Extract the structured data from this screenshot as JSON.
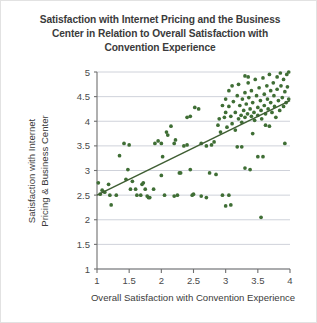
{
  "chart_data": {
    "type": "scatter",
    "title": "Satisfaction with Internet Pricing and the Business Center in Relation to Overall Satisfaction with Convention Experience",
    "title_lines": [
      "Satisfaction with Internet Pricing and the Business",
      "Center in Relation to Overall Satisfaction with",
      "Convention Experience"
    ],
    "xlabel": "Overall Satisfaction with Convention Experience",
    "ylabel": "Satisfaction with Internet Pricing & Business Center",
    "ylabel_lines": [
      "Satisfaction with Internet",
      "Pricing & Business Center"
    ],
    "xlim": [
      1,
      4
    ],
    "ylim": [
      1,
      5
    ],
    "xticks": [
      1,
      1.5,
      2,
      2.5,
      3,
      3.5,
      4
    ],
    "yticks": [
      1,
      1.5,
      2,
      2.5,
      3,
      3.5,
      4,
      4.5,
      5
    ],
    "xtick_labels": [
      "1",
      "1.5",
      "2",
      "2.5",
      "3",
      "3.5",
      "4"
    ],
    "ytick_labels": [
      "1",
      "1.5",
      "2",
      "2.5",
      "3",
      "3.5",
      "4",
      "4.5",
      "5"
    ],
    "grid": "horizontal",
    "legend": "none",
    "marker_color": "#3f6e35",
    "marker_size": 3,
    "trendline": {
      "type": "linear",
      "color": "#3f5e33",
      "x": [
        1.0,
        4.0
      ],
      "y": [
        2.5,
        4.42
      ]
    },
    "points": [
      [
        1.02,
        2.75
      ],
      [
        1.05,
        2.52
      ],
      [
        1.08,
        2.6
      ],
      [
        1.12,
        2.56
      ],
      [
        1.18,
        2.72
      ],
      [
        1.2,
        2.5
      ],
      [
        1.22,
        2.3
      ],
      [
        1.3,
        2.5
      ],
      [
        1.35,
        3.3
      ],
      [
        1.42,
        3.55
      ],
      [
        1.5,
        3.52
      ],
      [
        1.52,
        2.62
      ],
      [
        1.55,
        2.78
      ],
      [
        1.6,
        2.62
      ],
      [
        1.62,
        2.5
      ],
      [
        1.68,
        2.5
      ],
      [
        1.7,
        2.72
      ],
      [
        1.72,
        2.75
      ],
      [
        1.75,
        2.62
      ],
      [
        1.78,
        2.48
      ],
      [
        1.8,
        2.45
      ],
      [
        1.82,
        2.45
      ],
      [
        1.88,
        2.62
      ],
      [
        1.9,
        3.55
      ],
      [
        1.95,
        3.6
      ],
      [
        2.0,
        3.55
      ],
      [
        2.02,
        3.28
      ],
      [
        2.05,
        2.5
      ],
      [
        2.08,
        3.78
      ],
      [
        2.1,
        3.72
      ],
      [
        2.15,
        3.9
      ],
      [
        2.2,
        3.55
      ],
      [
        2.22,
        3.62
      ],
      [
        2.28,
        2.95
      ],
      [
        2.3,
        2.95
      ],
      [
        2.35,
        3.5
      ],
      [
        2.4,
        3.52
      ],
      [
        2.45,
        3.02
      ],
      [
        2.48,
        2.5
      ],
      [
        2.5,
        2.52
      ],
      [
        2.52,
        4.28
      ],
      [
        2.58,
        4.25
      ],
      [
        2.62,
        3.55
      ],
      [
        2.7,
        3.5
      ],
      [
        2.75,
        2.95
      ],
      [
        2.78,
        3.52
      ],
      [
        2.82,
        3.58
      ],
      [
        2.85,
        2.92
      ],
      [
        2.88,
        3.92
      ],
      [
        2.9,
        4.05
      ],
      [
        2.92,
        3.78
      ],
      [
        2.95,
        4.32
      ],
      [
        2.98,
        4.08
      ],
      [
        3.0,
        4.45
      ],
      [
        3.0,
        4.18
      ],
      [
        3.02,
        3.88
      ],
      [
        3.05,
        4.62
      ],
      [
        3.05,
        4.3
      ],
      [
        3.08,
        4.1
      ],
      [
        3.1,
        3.95
      ],
      [
        3.1,
        4.72
      ],
      [
        3.12,
        4.4
      ],
      [
        3.15,
        4.18
      ],
      [
        3.15,
        3.82
      ],
      [
        3.18,
        4.52
      ],
      [
        3.2,
        4.05
      ],
      [
        3.2,
        4.75
      ],
      [
        3.22,
        4.32
      ],
      [
        3.24,
        4.12
      ],
      [
        3.25,
        3.98
      ],
      [
        3.26,
        4.45
      ],
      [
        3.28,
        4.22
      ],
      [
        3.3,
        4.08
      ],
      [
        3.3,
        4.58
      ],
      [
        3.32,
        4.35
      ],
      [
        3.34,
        4.15
      ],
      [
        3.35,
        4.78
      ],
      [
        3.36,
        4.48
      ],
      [
        3.38,
        4.25
      ],
      [
        3.4,
        4.1
      ],
      [
        3.4,
        4.62
      ],
      [
        3.42,
        4.38
      ],
      [
        3.44,
        4.18
      ],
      [
        3.45,
        4.02
      ],
      [
        3.46,
        4.85
      ],
      [
        3.48,
        4.52
      ],
      [
        3.5,
        4.28
      ],
      [
        3.5,
        4.12
      ],
      [
        3.52,
        4.68
      ],
      [
        3.54,
        4.42
      ],
      [
        3.55,
        4.22
      ],
      [
        3.56,
        4.05
      ],
      [
        3.58,
        4.88
      ],
      [
        3.6,
        4.55
      ],
      [
        3.6,
        4.32
      ],
      [
        3.62,
        4.15
      ],
      [
        3.64,
        4.72
      ],
      [
        3.65,
        4.45
      ],
      [
        3.66,
        4.25
      ],
      [
        3.68,
        4.95
      ],
      [
        3.7,
        4.62
      ],
      [
        3.7,
        4.38
      ],
      [
        3.72,
        4.18
      ],
      [
        3.74,
        4.78
      ],
      [
        3.75,
        4.52
      ],
      [
        3.76,
        4.3
      ],
      [
        3.78,
        4.08
      ],
      [
        3.8,
        4.9
      ],
      [
        3.8,
        4.65
      ],
      [
        3.82,
        4.42
      ],
      [
        3.84,
        4.22
      ],
      [
        3.85,
        4.98
      ],
      [
        3.86,
        4.72
      ],
      [
        3.88,
        4.48
      ],
      [
        3.9,
        4.3
      ],
      [
        3.9,
        4.85
      ],
      [
        3.92,
        4.6
      ],
      [
        3.94,
        4.38
      ],
      [
        3.95,
        4.95
      ],
      [
        3.96,
        4.7
      ],
      [
        3.98,
        4.45
      ],
      [
        3.98,
        5.0
      ],
      [
        2.95,
        2.5
      ],
      [
        3.05,
        2.5
      ],
      [
        3.18,
        3.48
      ],
      [
        3.25,
        3.48
      ],
      [
        3.5,
        3.28
      ],
      [
        3.58,
        3.28
      ],
      [
        3.3,
        3.05
      ],
      [
        3.38,
        3.02
      ],
      [
        3.92,
        3.55
      ],
      [
        3.62,
        3.92
      ],
      [
        3.68,
        3.9
      ],
      [
        3.42,
        3.75
      ],
      [
        2.62,
        2.48
      ],
      [
        2.7,
        2.45
      ],
      [
        2.2,
        2.48
      ],
      [
        2.25,
        2.5
      ],
      [
        3.0,
        2.28
      ],
      [
        3.08,
        2.3
      ],
      [
        3.55,
        2.05
      ],
      [
        1.45,
        2.82
      ],
      [
        1.48,
        3.02
      ],
      [
        2.0,
        2.9
      ],
      [
        2.4,
        4.08
      ],
      [
        2.45,
        4.1
      ],
      [
        3.3,
        4.92
      ],
      [
        3.35,
        4.9
      ]
    ]
  }
}
